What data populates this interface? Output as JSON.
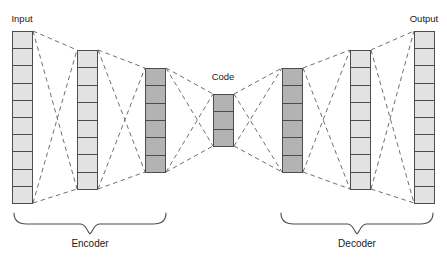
{
  "diagram": {
    "background_color": "#ffffff",
    "stroke_color": "#4d4d4d",
    "dash_color": "#707070",
    "text_color": "#1a1a1a",
    "fill_light": "#e2e2e2",
    "fill_dark": "#b3b3b3",
    "labels": {
      "input": "Input",
      "output": "Output",
      "code": "Code",
      "encoder": "Encoder",
      "decoder": "Decoder"
    },
    "layers": [
      {
        "id": "input-layer",
        "name": "Input",
        "units": 10,
        "x": 12,
        "width": 21,
        "top": 31,
        "bottom": 203,
        "shade": "light",
        "label": "Input",
        "label_x": 22,
        "label_y": 22
      },
      {
        "id": "encoder-hidden-1",
        "name": "Encoder hidden layer 1",
        "units": 8,
        "x": 77,
        "width": 21,
        "top": 50,
        "bottom": 189,
        "shade": "light",
        "label": "",
        "label_x": 87,
        "label_y": 44
      },
      {
        "id": "encoder-hidden-2",
        "name": "Encoder hidden layer 2",
        "units": 6,
        "x": 145,
        "width": 21,
        "top": 68,
        "bottom": 172,
        "shade": "dark",
        "label": "",
        "label_x": 155,
        "label_y": 62
      },
      {
        "id": "code-layer",
        "name": "Code",
        "units": 3,
        "x": 213,
        "width": 21,
        "top": 94,
        "bottom": 146,
        "shade": "dark",
        "label": "Code",
        "label_x": 223,
        "label_y": 80
      },
      {
        "id": "decoder-hidden-1",
        "name": "Decoder hidden layer 1",
        "units": 6,
        "x": 282,
        "width": 21,
        "top": 68,
        "bottom": 172,
        "shade": "dark",
        "label": "",
        "label_x": 292,
        "label_y": 62
      },
      {
        "id": "decoder-hidden-2",
        "name": "Decoder hidden layer 2",
        "units": 8,
        "x": 350,
        "width": 21,
        "top": 50,
        "bottom": 189,
        "shade": "light",
        "label": "",
        "label_x": 360,
        "label_y": 44
      },
      {
        "id": "output-layer",
        "name": "Output",
        "units": 10,
        "x": 414,
        "width": 21,
        "top": 31,
        "bottom": 203,
        "shade": "light",
        "label": "Output",
        "label_x": 424,
        "label_y": 22
      }
    ],
    "connections": [
      {
        "id": "conn-input-enc1",
        "from": "input-layer",
        "to": "encoder-hidden-1"
      },
      {
        "id": "conn-enc1-enc2",
        "from": "encoder-hidden-1",
        "to": "encoder-hidden-2"
      },
      {
        "id": "conn-enc2-code",
        "from": "encoder-hidden-2",
        "to": "code-layer"
      },
      {
        "id": "conn-code-dec1",
        "from": "code-layer",
        "to": "decoder-hidden-1"
      },
      {
        "id": "conn-dec1-dec2",
        "from": "decoder-hidden-1",
        "to": "decoder-hidden-2"
      },
      {
        "id": "conn-dec2-output",
        "from": "decoder-hidden-2",
        "to": "output-layer"
      }
    ],
    "braces": [
      {
        "id": "encoder-brace",
        "label": "Encoder",
        "x_start": 14,
        "x_end": 166,
        "y": 213,
        "depth": 11,
        "label_x": 90,
        "label_y": 247
      },
      {
        "id": "decoder-brace",
        "label": "Decoder",
        "x_start": 281,
        "x_end": 433,
        "y": 213,
        "depth": 11,
        "label_x": 357,
        "label_y": 247
      }
    ]
  }
}
